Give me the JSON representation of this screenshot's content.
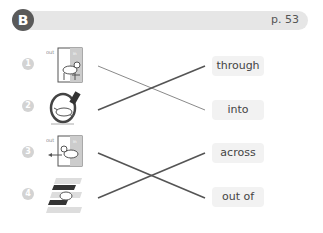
{
  "header": {
    "section_label": "B",
    "page_ref": "p. 53",
    "bar_color": "#e6e6e6",
    "badge_color": "#5a5a5a"
  },
  "pictures": [
    {
      "number": "1",
      "icon": "dog-walking-into-room-icon",
      "labels": [
        "out",
        "in"
      ]
    },
    {
      "number": "2",
      "icon": "dog-jumping-through-hoop-icon",
      "labels": []
    },
    {
      "number": "3",
      "icon": "dog-walking-out-of-room-icon",
      "labels": [
        "out",
        "in"
      ]
    },
    {
      "number": "4",
      "icon": "dog-walking-across-crosswalk-icon",
      "labels": []
    }
  ],
  "words": [
    {
      "label": "through"
    },
    {
      "label": "into"
    },
    {
      "label": "across"
    },
    {
      "label": "out of"
    }
  ],
  "matches": [
    {
      "picture": "1",
      "word": "into"
    },
    {
      "picture": "2",
      "word": "through"
    },
    {
      "picture": "3",
      "word": "out of"
    },
    {
      "picture": "4",
      "word": "across"
    }
  ]
}
